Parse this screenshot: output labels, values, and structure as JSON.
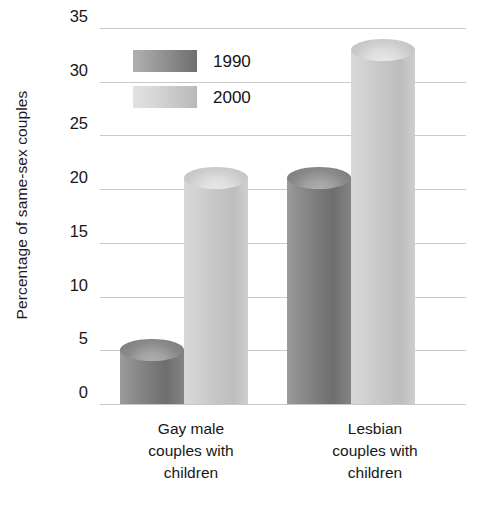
{
  "chart_data": {
    "type": "bar",
    "title": "",
    "subtitle": "",
    "xlabel": "",
    "ylabel": "Percentage of same-sex couples",
    "ylim": [
      0,
      35
    ],
    "ytick_values": [
      0,
      5,
      10,
      15,
      20,
      25,
      30,
      35
    ],
    "ytick_labels": [
      "0",
      "5",
      "10",
      "15",
      "20",
      "25",
      "30",
      "35"
    ],
    "grid": true,
    "legend_position": "upper-left-inside",
    "categories": [
      "Gay male couples with children",
      "Lesbian couples with children"
    ],
    "category_lines": [
      [
        "Gay male",
        "couples with",
        "children"
      ],
      [
        "Lesbian",
        "couples with",
        "children"
      ]
    ],
    "series": [
      {
        "name": "1990",
        "color": "#808080",
        "values": [
          5,
          21
        ]
      },
      {
        "name": "2000",
        "color": "#c9c9c9",
        "values": [
          21,
          33
        ]
      }
    ]
  },
  "legend": {
    "items": [
      {
        "label": "1990",
        "swatch": "legend-swatch-1990"
      },
      {
        "label": "2000",
        "swatch": "legend-swatch-2000"
      }
    ]
  },
  "axis": {
    "y_title": "Percentage of same-sex couples"
  }
}
